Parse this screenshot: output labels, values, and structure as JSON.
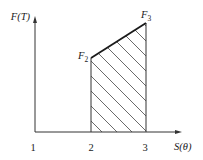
{
  "diagram": {
    "type": "area-under-curve",
    "axes": {
      "y_label": "F(T)",
      "x_label": "S(θ)",
      "origin_label": "1"
    },
    "ticks": {
      "x2": "2",
      "x3": "3"
    },
    "points": {
      "F2": {
        "label_main": "F",
        "label_sub": "2"
      },
      "F3": {
        "label_main": "F",
        "label_sub": "3"
      }
    },
    "region": {
      "description": "Hatched area bounded by x=2, x=3, the S-axis and the segment F2–F3",
      "hatch": "diagonal"
    },
    "colors": {
      "line": "#1a1a1a",
      "axis": "#333333",
      "hatch": "#444444"
    }
  }
}
